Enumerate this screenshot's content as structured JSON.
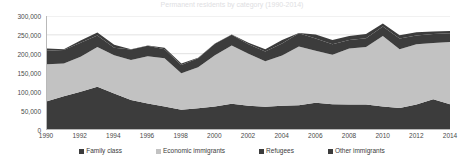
{
  "chart_data": {
    "type": "area",
    "stacked": true,
    "title": "Permanent residents by category (1990-2014)",
    "xlabel": "",
    "ylabel": "",
    "ylim": [
      0,
      300000
    ],
    "xlim": [
      1990,
      2014
    ],
    "grid": true,
    "legend_position": "bottom",
    "y_ticks": [
      "0",
      "50,000",
      "100,000",
      "150,000",
      "200,000",
      "250,000",
      "300,000"
    ],
    "y_tick_values": [
      0,
      50000,
      100000,
      150000,
      200000,
      250000,
      300000
    ],
    "x_ticks": [
      "1990",
      "1992",
      "1994",
      "1996",
      "1998",
      "2000",
      "2002",
      "2004",
      "2006",
      "2008",
      "2010",
      "2012",
      "2014"
    ],
    "x": [
      1990,
      1991,
      1992,
      1993,
      1994,
      1995,
      1996,
      1997,
      1998,
      1999,
      2000,
      2001,
      2002,
      2003,
      2004,
      2005,
      2006,
      2007,
      2008,
      2009,
      2010,
      2011,
      2012,
      2013,
      2014
    ],
    "series": [
      {
        "name": "Family class",
        "color": "#3c3c3c",
        "values": [
          74000,
          87000,
          99000,
          112000,
          94000,
          77000,
          68000,
          60000,
          51000,
          55000,
          60000,
          67000,
          62000,
          59000,
          62000,
          63000,
          70000,
          66000,
          65000,
          65000,
          60000,
          56000,
          65000,
          79000,
          66000
        ]
      },
      {
        "name": "Economic immigrants",
        "color": "#c2c2c2",
        "values": [
          98000,
          87000,
          93000,
          106000,
          102000,
          106000,
          125000,
          128000,
          97000,
          109000,
          136000,
          155000,
          138000,
          121000,
          133000,
          156000,
          138000,
          131000,
          149000,
          153000,
          187000,
          156000,
          160000,
          149000,
          165000
        ]
      },
      {
        "name": "Refugees",
        "color": "#3c3c3c",
        "values": [
          36000,
          36000,
          37000,
          30000,
          20000,
          28000,
          28000,
          24000,
          22000,
          24000,
          30000,
          28000,
          25000,
          26000,
          32000,
          35000,
          32000,
          28000,
          22000,
          23000,
          25000,
          28000,
          23000,
          24000,
          23000
        ]
      },
      {
        "name": "Other immigrants",
        "color": "#3c3c3c",
        "values": [
          6000,
          2000,
          6000,
          8000,
          8000,
          1000,
          1000,
          4000,
          4000,
          1000,
          1000,
          1000,
          4000,
          6000,
          9000,
          1000,
          11000,
          11000,
          11000,
          11000,
          8000,
          9000,
          9000,
          7000,
          6000
        ]
      }
    ]
  },
  "legend": {
    "items": [
      {
        "label": "Family class",
        "color": "#3c3c3c"
      },
      {
        "label": "Economic immigrants",
        "color": "#c2c2c2"
      },
      {
        "label": "Refugees",
        "color": "#3c3c3c"
      },
      {
        "label": "Other immigrants",
        "color": "#3c3c3c"
      }
    ]
  }
}
